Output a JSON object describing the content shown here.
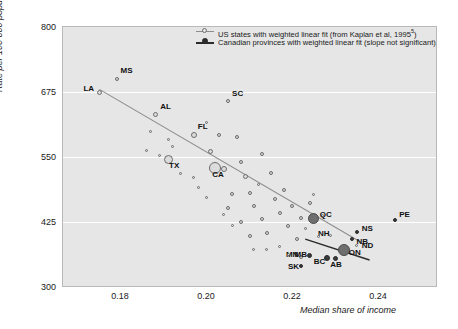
{
  "chart_data": {
    "type": "scatter",
    "title": "",
    "xlabel": "Median share of income",
    "ylabel": "Rate per 100 000 population",
    "xlim": [
      0.165,
      0.252
    ],
    "ylim": [
      300,
      800
    ],
    "xticks": [
      "0.18",
      "0.20",
      "0.22",
      "0.24"
    ],
    "yticks": [
      "800",
      "675",
      "550",
      "425",
      "300"
    ],
    "grid": "horizontal-white",
    "legend_position": "top-right-inside",
    "legend": [
      {
        "key": "us-states",
        "label": "US states with weighted linear fit (from Kaplan et al, 1995",
        "superscript": "5",
        "suffix": ")",
        "marker": "open-circle",
        "line": "gray"
      },
      {
        "key": "canadian-provinces",
        "label": "Canadian provinces with weighted linear fit (slope not significant)",
        "marker": "filled-circle",
        "line": "black"
      }
    ],
    "series": [
      {
        "name": "US states with weighted linear fit (from Kaplan et al, 1995)",
        "marker": "open-circle",
        "points": [
          {
            "label": "LA",
            "x": 0.1735,
            "y": 675,
            "size": 5
          },
          {
            "label": "MS",
            "x": 0.1775,
            "y": 700,
            "size": 4
          },
          {
            "label": "AL",
            "x": 0.1865,
            "y": 632,
            "size": 5
          },
          {
            "label": "SC",
            "x": 0.2035,
            "y": 657,
            "size": 4
          },
          {
            "label": "FL",
            "x": 0.1955,
            "y": 592,
            "size": 6
          },
          {
            "label": "TX",
            "x": 0.1895,
            "y": 545,
            "size": 9
          },
          {
            "label": "CA",
            "x": 0.2005,
            "y": 528,
            "size": 12
          },
          {
            "label": "MN",
            "x": 0.2205,
            "y": 358,
            "size": 4
          },
          {
            "label": "NH",
            "x": 0.2275,
            "y": 400,
            "size": 3
          },
          {
            "label": "ND",
            "x": 0.2335,
            "y": 380,
            "size": 3
          },
          {
            "label": "",
            "x": 0.1855,
            "y": 600,
            "size": 3
          },
          {
            "label": "",
            "x": 0.1895,
            "y": 583,
            "size": 3
          },
          {
            "label": "",
            "x": 0.1905,
            "y": 570,
            "size": 3
          },
          {
            "label": "",
            "x": 0.1925,
            "y": 518,
            "size": 3
          },
          {
            "label": "",
            "x": 0.1955,
            "y": 510,
            "size": 3
          },
          {
            "label": "",
            "x": 0.1985,
            "y": 617,
            "size": 3
          },
          {
            "label": "",
            "x": 0.1995,
            "y": 560,
            "size": 5
          },
          {
            "label": "",
            "x": 0.2015,
            "y": 592,
            "size": 4
          },
          {
            "label": "",
            "x": 0.2025,
            "y": 526,
            "size": 6
          },
          {
            "label": "",
            "x": 0.2055,
            "y": 588,
            "size": 4
          },
          {
            "label": "",
            "x": 0.2065,
            "y": 540,
            "size": 4
          },
          {
            "label": "",
            "x": 0.2075,
            "y": 512,
            "size": 5
          },
          {
            "label": "",
            "x": 0.2085,
            "y": 480,
            "size": 4
          },
          {
            "label": "",
            "x": 0.2045,
            "y": 478,
            "size": 4
          },
          {
            "label": "",
            "x": 0.2035,
            "y": 452,
            "size": 4
          },
          {
            "label": "",
            "x": 0.2095,
            "y": 455,
            "size": 4
          },
          {
            "label": "",
            "x": 0.2105,
            "y": 497,
            "size": 3
          },
          {
            "label": "",
            "x": 0.2115,
            "y": 430,
            "size": 4
          },
          {
            "label": "",
            "x": 0.2065,
            "y": 425,
            "size": 4
          },
          {
            "label": "",
            "x": 0.2115,
            "y": 556,
            "size": 4
          },
          {
            "label": "",
            "x": 0.2135,
            "y": 520,
            "size": 4
          },
          {
            "label": "",
            "x": 0.2145,
            "y": 470,
            "size": 4
          },
          {
            "label": "",
            "x": 0.2155,
            "y": 443,
            "size": 4
          },
          {
            "label": "",
            "x": 0.2125,
            "y": 404,
            "size": 4
          },
          {
            "label": "",
            "x": 0.2085,
            "y": 398,
            "size": 4
          },
          {
            "label": "",
            "x": 0.2165,
            "y": 487,
            "size": 4
          },
          {
            "label": "",
            "x": 0.2175,
            "y": 418,
            "size": 4
          },
          {
            "label": "",
            "x": 0.2185,
            "y": 455,
            "size": 4
          },
          {
            "label": "",
            "x": 0.2195,
            "y": 392,
            "size": 4
          },
          {
            "label": "",
            "x": 0.2205,
            "y": 432,
            "size": 4
          },
          {
            "label": "",
            "x": 0.2225,
            "y": 462,
            "size": 4
          },
          {
            "label": "",
            "x": 0.2215,
            "y": 412,
            "size": 3
          },
          {
            "label": "",
            "x": 0.2245,
            "y": 398,
            "size": 3
          },
          {
            "label": "",
            "x": 0.2255,
            "y": 437,
            "size": 3
          },
          {
            "label": "",
            "x": 0.2155,
            "y": 378,
            "size": 3
          },
          {
            "label": "",
            "x": 0.2175,
            "y": 362,
            "size": 3
          },
          {
            "label": "",
            "x": 0.2125,
            "y": 372,
            "size": 3
          },
          {
            "label": "",
            "x": 0.2095,
            "y": 372,
            "size": 3
          },
          {
            "label": "",
            "x": 0.1985,
            "y": 472,
            "size": 3
          },
          {
            "label": "",
            "x": 0.1965,
            "y": 492,
            "size": 3
          },
          {
            "label": "",
            "x": 0.1875,
            "y": 553,
            "size": 3
          },
          {
            "label": "",
            "x": 0.1845,
            "y": 562,
            "size": 3
          },
          {
            "label": "",
            "x": 0.2235,
            "y": 478,
            "size": 3
          },
          {
            "label": "",
            "x": 0.2045,
            "y": 418,
            "size": 3
          },
          {
            "label": "",
            "x": 0.2025,
            "y": 440,
            "size": 3
          }
        ]
      },
      {
        "name": "Canadian provinces with weighted linear fit (slope not significant)",
        "marker": "filled-circle",
        "points": [
          {
            "label": "QC",
            "x": 0.2235,
            "y": 432,
            "size": 11
          },
          {
            "label": "ON",
            "x": 0.2305,
            "y": 372,
            "size": 12
          },
          {
            "label": "MB",
            "x": 0.2225,
            "y": 360,
            "size": 5
          },
          {
            "label": "BC",
            "x": 0.2265,
            "y": 356,
            "size": 6
          },
          {
            "label": "AB",
            "x": 0.2285,
            "y": 355,
            "size": 5
          },
          {
            "label": "SK",
            "x": 0.2205,
            "y": 340,
            "size": 4
          },
          {
            "label": "NB",
            "x": 0.2325,
            "y": 392,
            "size": 4
          },
          {
            "label": "NS",
            "x": 0.2335,
            "y": 405,
            "size": 4
          },
          {
            "label": "PE",
            "x": 0.2425,
            "y": 428,
            "size": 4
          }
        ]
      }
    ],
    "fit_lines": [
      {
        "name": "us-fit",
        "color": "#8d8d8d",
        "x1": 0.1735,
        "y1": 680,
        "x2": 0.2345,
        "y2": 386
      },
      {
        "name": "canada-fit",
        "color": "#2b2b2b",
        "x1": 0.2215,
        "y1": 392,
        "x2": 0.2365,
        "y2": 352
      }
    ]
  }
}
